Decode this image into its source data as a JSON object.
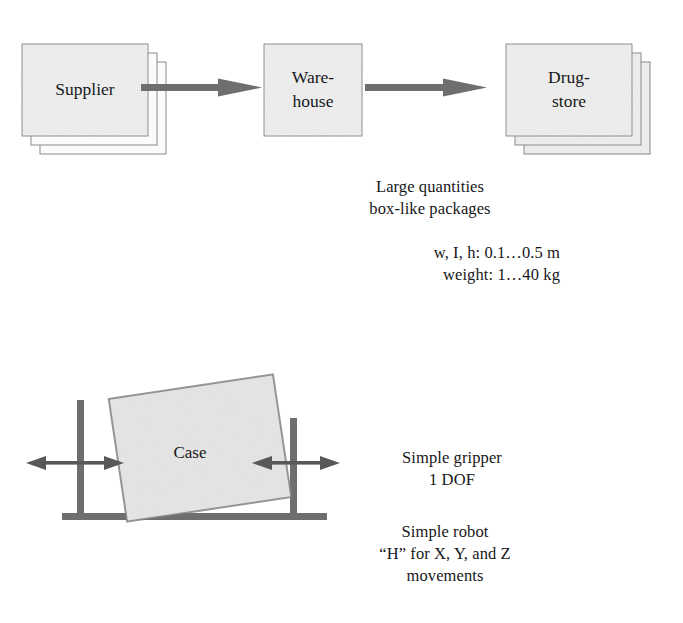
{
  "flow": {
    "nodes": [
      {
        "id": "supplier",
        "label": "Supplier",
        "lines": [
          "Supplier"
        ],
        "stacked": true,
        "stack_count": 3
      },
      {
        "id": "warehouse",
        "label": "Warehouse",
        "lines": [
          "Ware-",
          "house"
        ],
        "stacked": false,
        "stack_count": 1
      },
      {
        "id": "drugstore",
        "label": "Drugstore",
        "lines": [
          "Drug-",
          "store"
        ],
        "stacked": true,
        "stack_count": 3
      }
    ],
    "arrows": [
      {
        "from": "supplier",
        "to": "warehouse"
      },
      {
        "from": "warehouse",
        "to": "drugstore"
      }
    ]
  },
  "captions": {
    "quantities": "Large quantities\nbox-like packages",
    "dimensions": "w, I, h: 0.1…0.5 m\nweight: 1…40 kg",
    "gripper": "Simple gripper\n1 DOF",
    "robot": "Simple robot\n“H” for X, Y, and Z\nmovements"
  },
  "robot": {
    "case_label": "Case",
    "gripper_arrows": 2,
    "degrees_of_freedom": "1 DOF"
  },
  "colors": {
    "box_fill": "#efefef",
    "box_stroke": "#8a8a8a",
    "arrow": "#6e6e6e",
    "robot_part": "#6e6e6e",
    "case_fill": "#e6e6e6",
    "case_stroke": "#767676",
    "text": "#17171a",
    "background": "#ffffff"
  }
}
